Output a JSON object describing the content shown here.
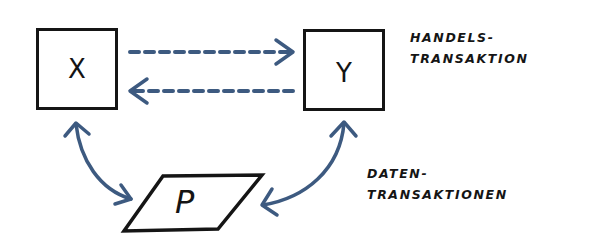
{
  "diagram": {
    "nodes": {
      "x": {
        "label": "X"
      },
      "y": {
        "label": "Y"
      },
      "p": {
        "label": "P"
      }
    },
    "captions": {
      "trade": {
        "line1": "HANDELS-",
        "line2": "TRANSAKTION"
      },
      "data": {
        "line1": "DATEN-",
        "line2": "TRANSAKTIONEN"
      }
    },
    "edges": [
      {
        "from": "X",
        "to": "Y",
        "style": "dashed",
        "direction": "forward",
        "kind": "trade"
      },
      {
        "from": "Y",
        "to": "X",
        "style": "dashed",
        "direction": "forward",
        "kind": "trade"
      },
      {
        "from": "X",
        "to": "P",
        "style": "solid-curved",
        "direction": "bidirectional",
        "kind": "data"
      },
      {
        "from": "Y",
        "to": "P",
        "style": "solid-curved",
        "direction": "bidirectional",
        "kind": "data"
      }
    ],
    "colors": {
      "arrow": "#3d5a80",
      "ink": "#151515",
      "background": "#ffffff"
    }
  }
}
